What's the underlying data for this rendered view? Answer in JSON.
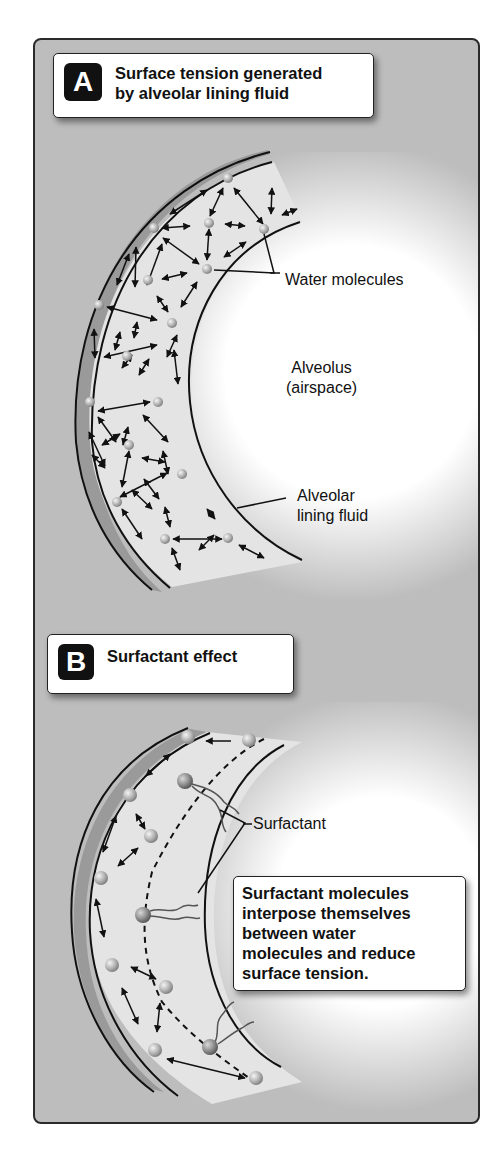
{
  "figure": {
    "panels": [
      {
        "letter": "A",
        "title_line1": "Surface tension generated",
        "title_line2": "by alveolar lining fluid",
        "labels": {
          "water_molecules": "Water molecules",
          "alveolus_line1": "Alveolus",
          "alveolus_line2": "(airspace)",
          "lining_line1": "Alveolar",
          "lining_line2": "lining fluid"
        }
      },
      {
        "letter": "B",
        "title_line1": "Surfactant effect",
        "labels": {
          "surfactant": "Surfactant"
        },
        "note_lines": [
          "Surfactant molecules",
          "interpose themselves",
          "between water",
          "molecules and reduce",
          "surface tension."
        ]
      }
    ],
    "colors": {
      "background_gray": "#bdbdbd",
      "fluid_fill": "#e4e4e4",
      "airspace_glow": "#ffffff",
      "wall_band": "#9a9a9a",
      "line": "#111111"
    }
  }
}
